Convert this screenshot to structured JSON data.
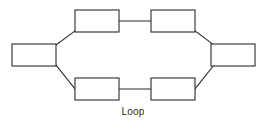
{
  "figure": {
    "caption": "Loop",
    "background_color": "#ffffff",
    "line_color": "#2b2b2b",
    "node_fill_color": "#ffffff",
    "width": 266,
    "height": 132
  },
  "diagram": {
    "type": "network-topology",
    "topology_name": "Loop",
    "node_count": 6,
    "link_count": 6,
    "nodes": [
      {
        "id": "node-left",
        "label": "",
        "x": 12,
        "y": 44,
        "width": 44,
        "height": 22
      },
      {
        "id": "node-top-left",
        "label": "",
        "x": 75,
        "y": 10,
        "width": 44,
        "height": 22
      },
      {
        "id": "node-top-right",
        "label": "",
        "x": 151,
        "y": 10,
        "width": 44,
        "height": 22
      },
      {
        "id": "node-right",
        "label": "",
        "x": 211,
        "y": 44,
        "width": 44,
        "height": 22
      },
      {
        "id": "node-bottom-right",
        "label": "",
        "x": 151,
        "y": 78,
        "width": 44,
        "height": 22
      },
      {
        "id": "node-bottom-left",
        "label": "",
        "x": 75,
        "y": 78,
        "width": 44,
        "height": 22
      }
    ],
    "links": [
      {
        "id": "link-left-to-top-left",
        "from": "node-left",
        "to": "node-top-left",
        "x1": 56,
        "y1": 45,
        "x2": 75,
        "y2": 31
      },
      {
        "id": "link-top-left-to-top-right",
        "from": "node-top-left",
        "to": "node-top-right",
        "x1": 119,
        "y1": 21,
        "x2": 151,
        "y2": 21
      },
      {
        "id": "link-top-right-to-right",
        "from": "node-top-right",
        "to": "node-right",
        "x1": 195,
        "y1": 31,
        "x2": 214,
        "y2": 45
      },
      {
        "id": "link-right-to-bottom-right",
        "from": "node-right",
        "to": "node-bottom-right",
        "x1": 214,
        "y1": 65,
        "x2": 195,
        "y2": 89
      },
      {
        "id": "link-bottom-right-to-bottom-left",
        "from": "node-bottom-right",
        "to": "node-bottom-left",
        "x1": 151,
        "y1": 89,
        "x2": 119,
        "y2": 89
      },
      {
        "id": "link-bottom-left-to-left",
        "from": "node-bottom-left",
        "to": "node-left",
        "x1": 75,
        "y1": 89,
        "x2": 56,
        "y2": 65
      }
    ]
  }
}
